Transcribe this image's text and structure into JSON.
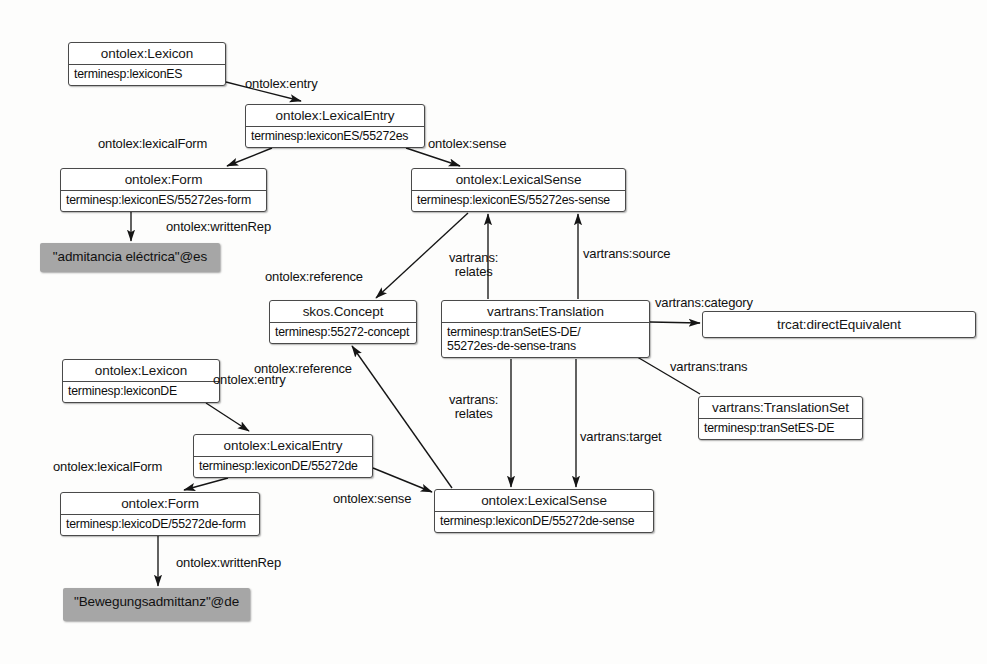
{
  "diagram": {
    "canvas": {
      "width": 987,
      "height": 664
    },
    "colors": {
      "node_fill": "#ffffff",
      "node_border": "#4a4a4a",
      "literal_fill": "#a6a6a6",
      "edge": "#1a1a1a",
      "background": "#fdfdfc"
    },
    "nodes": [
      {
        "id": "lexiconES",
        "title": "ontolex:Lexicon",
        "body": "terminesp:lexiconES",
        "x": 68,
        "y": 42,
        "w": 158,
        "h": 44,
        "style": "class"
      },
      {
        "id": "lexEntryES",
        "title": "ontolex:LexicalEntry",
        "body": "terminesp:lexiconES/55272es",
        "x": 245,
        "y": 104,
        "w": 180,
        "h": 44,
        "style": "class"
      },
      {
        "id": "formES",
        "title": "ontolex:Form",
        "body": "terminesp:lexiconES/55272es-form",
        "x": 60,
        "y": 168,
        "w": 207,
        "h": 44,
        "style": "class"
      },
      {
        "id": "writtenRepES",
        "title": "\"admitancia eléctrica\"@es",
        "body": "",
        "x": 40,
        "y": 243,
        "w": 180,
        "h": 29,
        "style": "literal"
      },
      {
        "id": "lexSenseES",
        "title": "ontolex:LexicalSense",
        "body": "terminesp:lexiconES/55272es-sense",
        "x": 411,
        "y": 168,
        "w": 215,
        "h": 44,
        "style": "class"
      },
      {
        "id": "skosConcept",
        "title": "skos.Concept",
        "body": "terminesp:55272-concept",
        "x": 269,
        "y": 300,
        "w": 148,
        "h": 44,
        "style": "class"
      },
      {
        "id": "translation",
        "title": "vartrans:Translation",
        "body": "terminesp:tranSetES-DE/\n55272es-de-sense-trans",
        "x": 441,
        "y": 300,
        "w": 209,
        "h": 58,
        "style": "class"
      },
      {
        "id": "trcatCategory",
        "title": "trcat:directEquivalent",
        "body": "",
        "x": 702,
        "y": 311,
        "w": 274,
        "h": 25,
        "style": "single"
      },
      {
        "id": "translationSet",
        "title": "vartrans:TranslationSet",
        "body": "terminesp:tranSetES-DE",
        "x": 698,
        "y": 396,
        "w": 165,
        "h": 44,
        "style": "class"
      },
      {
        "id": "lexiconDE",
        "title": "ontolex:Lexicon",
        "body": "terminesp:lexiconDE",
        "x": 62,
        "y": 359,
        "w": 158,
        "h": 44,
        "style": "class"
      },
      {
        "id": "lexEntryDE",
        "title": "ontolex:LexicalEntry",
        "body": "terminesp:lexiconDE/55272de",
        "x": 193,
        "y": 434,
        "w": 180,
        "h": 44,
        "style": "class"
      },
      {
        "id": "formDE",
        "title": "ontolex:Form",
        "body": "terminesp:lexicoDE/55272de-form",
        "x": 60,
        "y": 492,
        "w": 200,
        "h": 44,
        "style": "class"
      },
      {
        "id": "writtenRepDE",
        "title": "\"Bewegungsadmittanz\"@de",
        "body": "",
        "x": 63,
        "y": 588,
        "w": 187,
        "h": 33,
        "style": "literal"
      },
      {
        "id": "lexSenseDE",
        "title": "ontolex:LexicalSense",
        "body": "terminesp:lexiconDE/55272de-sense",
        "x": 434,
        "y": 489,
        "w": 220,
        "h": 44,
        "style": "class"
      }
    ],
    "edge_labels": [
      {
        "id": "entryES",
        "text": "ontolex:entry",
        "x": 245,
        "y": 77,
        "align": "left"
      },
      {
        "id": "lexicalFormES",
        "text": "ontolex:lexicalForm",
        "x": 98,
        "y": 137,
        "align": "left"
      },
      {
        "id": "senseES",
        "text": "ontolex:sense",
        "x": 428,
        "y": 137,
        "align": "left"
      },
      {
        "id": "writtenRepESL",
        "text": "ontolex:writtenRep",
        "x": 166,
        "y": 220,
        "align": "left"
      },
      {
        "id": "referenceES",
        "text": "ontolex:reference",
        "x": 265,
        "y": 270,
        "align": "left"
      },
      {
        "id": "relatesTop",
        "text": "vartrans:\nrelates",
        "x": 449,
        "y": 251,
        "align": "center"
      },
      {
        "id": "source",
        "text": "vartrans:source",
        "x": 583,
        "y": 247,
        "align": "left"
      },
      {
        "id": "category",
        "text": "vartrans:category",
        "x": 655,
        "y": 296,
        "align": "left"
      },
      {
        "id": "trans",
        "text": "vartrans:trans",
        "x": 670,
        "y": 360,
        "align": "left"
      },
      {
        "id": "entryDE",
        "text": "ontolex:entry",
        "x": 213,
        "y": 373,
        "align": "left"
      },
      {
        "id": "referenceDE",
        "text": "ontolex:reference",
        "x": 254,
        "y": 362,
        "align": "left"
      },
      {
        "id": "relatesBottom",
        "text": "vartrans:\nrelates",
        "x": 449,
        "y": 393,
        "align": "center"
      },
      {
        "id": "target",
        "text": "vartrans:target",
        "x": 580,
        "y": 430,
        "align": "left"
      },
      {
        "id": "lexicalFormDE",
        "text": "ontolex:lexicalForm",
        "x": 53,
        "y": 460,
        "align": "left"
      },
      {
        "id": "senseDE",
        "text": "ontolex:sense",
        "x": 333,
        "y": 492,
        "align": "left"
      },
      {
        "id": "writtenRepDEL",
        "text": "ontolex:writtenRep",
        "x": 176,
        "y": 556,
        "align": "left"
      }
    ],
    "edges": [
      {
        "id": "e-lexiconES-entry",
        "label": "ontolex:entry",
        "from": "lexiconES",
        "to": "lexEntryES",
        "path": "M 226,82 L 301,101",
        "arrow": true
      },
      {
        "id": "e-lexEntryES-form",
        "label": "ontolex:lexicalForm",
        "from": "lexEntryES",
        "to": "formES",
        "path": "M 272,148 L 227,166",
        "arrow": true
      },
      {
        "id": "e-lexEntryES-sense",
        "label": "ontolex:sense",
        "from": "lexEntryES",
        "to": "lexSenseES",
        "path": "M 406,148 L 460,166",
        "arrow": true
      },
      {
        "id": "e-formES-writtenRep",
        "label": "ontolex:writtenRep",
        "from": "formES",
        "to": "writtenRepES",
        "path": "M 131,212 L 131,241",
        "arrow": true
      },
      {
        "id": "e-lexSenseES-reference",
        "label": "ontolex:reference",
        "from": "lexSenseES",
        "to": "skosConcept",
        "path": "M 468,213 L 376,298",
        "arrow": true
      },
      {
        "id": "e-translation-relates-1",
        "label": "vartrans:relates",
        "from": "translation",
        "to": "lexSenseES",
        "path": "M 488,299 L 488,214",
        "arrow": true
      },
      {
        "id": "e-translation-source",
        "label": "vartrans:source",
        "from": "translation",
        "to": "lexSenseES",
        "path": "M 578,299 L 578,214",
        "arrow": true
      },
      {
        "id": "e-translation-category",
        "label": "vartrans:category",
        "from": "translation",
        "to": "trcatCategory",
        "path": "M 650,322 L 700,323",
        "arrow": true
      },
      {
        "id": "e-transSet-trans",
        "label": "vartrans:trans",
        "from": "translationSet",
        "to": "translation",
        "path": "M 700,394 L 622,348",
        "arrow": true
      },
      {
        "id": "e-lexiconDE-entry",
        "label": "ontolex:entry",
        "from": "lexiconDE",
        "to": "lexEntryDE",
        "path": "M 206,403 L 249,431",
        "arrow": true
      },
      {
        "id": "e-lexEntryDE-form",
        "label": "ontolex:lexicalForm",
        "from": "lexEntryDE",
        "to": "formDE",
        "path": "M 228,478 L 184,490",
        "arrow": true
      },
      {
        "id": "e-lexEntryDE-sense",
        "label": "ontolex:sense",
        "from": "lexEntryDE",
        "to": "lexSenseDE",
        "path": "M 373,468 L 432,492",
        "arrow": true
      },
      {
        "id": "e-formDE-writtenRep",
        "label": "ontolex:writtenRep",
        "from": "formDE",
        "to": "writtenRepDE",
        "path": "M 158,536 L 158,586",
        "arrow": true
      },
      {
        "id": "e-lexSenseDE-reference",
        "label": "ontolex:reference",
        "from": "lexSenseDE",
        "to": "skosConcept",
        "path": "M 452,488 L 352,346",
        "arrow": true
      },
      {
        "id": "e-translation-relates-2",
        "label": "vartrans:relates",
        "from": "translation",
        "to": "lexSenseDE",
        "path": "M 511,359 L 511,487",
        "arrow": true
      },
      {
        "id": "e-translation-target",
        "label": "vartrans:target",
        "from": "translation",
        "to": "lexSenseDE",
        "path": "M 576,359 L 576,487",
        "arrow": true
      }
    ]
  }
}
